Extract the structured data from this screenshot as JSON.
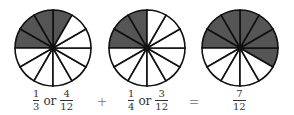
{
  "colors": {
    "shaded": "#555555",
    "unshaded": "#ffffff",
    "stroke": "#111111"
  },
  "circles": [
    {
      "cx": 53,
      "cy": 48,
      "r": 38,
      "segments": 12,
      "shaded_count": 4,
      "start_deg": 60
    },
    {
      "cx": 147,
      "cy": 48,
      "r": 38,
      "segments": 12,
      "shaded_count": 3,
      "start_deg": 90
    },
    {
      "cx": 240,
      "cy": 48,
      "r": 38,
      "segments": 12,
      "shaded_count": 7,
      "start_deg": -30
    }
  ],
  "labels": {
    "first": {
      "a_num": "1",
      "a_den": "3",
      "or": "or",
      "b_num": "4",
      "b_den": "12"
    },
    "plus": "+",
    "second": {
      "a_num": "1",
      "a_den": "4",
      "or": "or",
      "b_num": "3",
      "b_den": "12"
    },
    "equals": "=",
    "result": {
      "num": "7",
      "den": "12"
    }
  }
}
